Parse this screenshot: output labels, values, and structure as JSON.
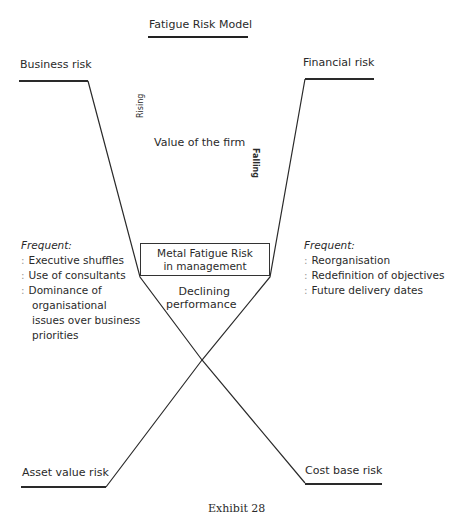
{
  "title": "Fatigue Risk Model",
  "corners": {
    "top_left": "Business risk",
    "top_right": "Financial risk",
    "bottom_left": "Asset value risk",
    "bottom_right": "Cost base risk"
  },
  "center": {
    "value_label": "Value of the firm",
    "rising_label": "Rising",
    "falling_label": "Falling",
    "box_line1": "Metal Fatigue Risk",
    "box_line2": "in management",
    "declining_line1": "Declining",
    "declining_line2": "performance"
  },
  "left_list": {
    "heading": "Frequent:",
    "items": [
      [
        "Executive shuffles"
      ],
      [
        "Use of consultants"
      ],
      [
        "Dominance of",
        "organisational",
        "issues over business",
        "priorities"
      ]
    ]
  },
  "right_list": {
    "heading": "Frequent:",
    "items": [
      "Reorganisation",
      "Redefinition of objectives",
      "Future delivery dates"
    ]
  },
  "caption": "Exhibit 28",
  "colon": ":"
}
